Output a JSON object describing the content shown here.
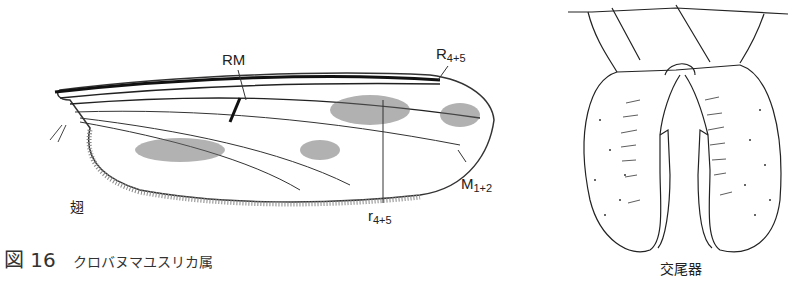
{
  "figure": {
    "caption_prefix": "図 16",
    "caption_name": "クロバヌマユスリカ属"
  },
  "wing": {
    "label": "翅",
    "annotations": {
      "rm": "RM",
      "r45_upper": "R",
      "r45_upper_sub": "4+5",
      "m12": "M",
      "m12_sub": "1+2",
      "r45_lower": "r",
      "r45_lower_sub": "4+5"
    }
  },
  "genitalia": {
    "label": "交尾器"
  }
}
